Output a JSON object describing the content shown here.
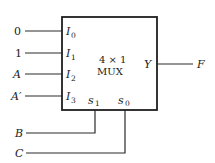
{
  "diagram": {
    "type": "multiplexer",
    "block": {
      "title_line1": "4 × 1",
      "title_line2": "MUX"
    },
    "data_inputs": [
      {
        "signal": "0",
        "pin": "I",
        "pin_sub": "0"
      },
      {
        "signal": "1",
        "pin": "I",
        "pin_sub": "1"
      },
      {
        "signal": "A",
        "pin": "I",
        "pin_sub": "2"
      },
      {
        "signal": "A′",
        "pin": "I",
        "pin_sub": "3"
      }
    ],
    "select_inputs": [
      {
        "signal": "B",
        "pin": "s",
        "pin_sub": "1"
      },
      {
        "signal": "C",
        "pin": "s",
        "pin_sub": "0"
      }
    ],
    "output": {
      "pin": "Y",
      "signal": "F"
    }
  }
}
